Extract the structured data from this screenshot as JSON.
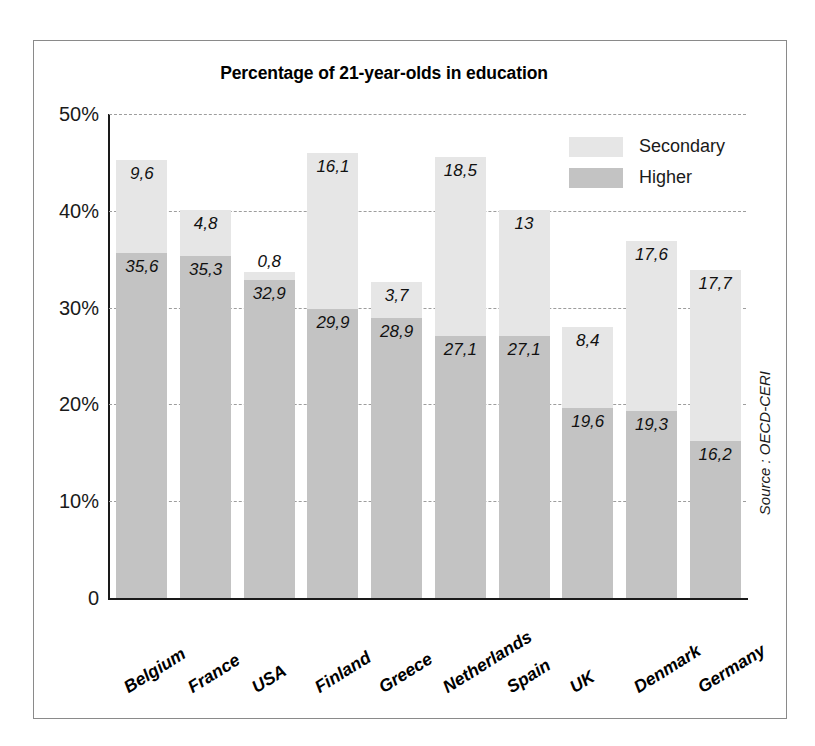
{
  "chart_data": {
    "type": "bar",
    "subtype": "stacked-vertical",
    "title": "Percentage of 21-year-olds in education",
    "xlabel": "",
    "ylabel": "",
    "ylim": [
      0,
      50
    ],
    "yunit": "%",
    "ytick_labels": [
      "0",
      "10%",
      "20%",
      "30%",
      "40%",
      "50%"
    ],
    "ytick_values": [
      0,
      10,
      20,
      30,
      40,
      50
    ],
    "grid": true,
    "grid_style": "dashed-horizontal",
    "legend_position": "top-right",
    "categories": [
      "Belgium",
      "France",
      "USA",
      "Finland",
      "Greece",
      "Netherlands",
      "Spain",
      "UK",
      "Denmark",
      "Germany"
    ],
    "series": [
      {
        "name": "Higher",
        "color": "#c3c3c3",
        "values": [
          35.6,
          35.3,
          32.9,
          29.9,
          28.9,
          27.1,
          27.1,
          19.6,
          19.3,
          16.2
        ],
        "labels": [
          "35,6",
          "35,3",
          "32,9",
          "29,9",
          "28,9",
          "27,1",
          "27,1",
          "19,6",
          "19,3",
          "16,2"
        ]
      },
      {
        "name": "Secondary",
        "color": "#e6e6e6",
        "values": [
          9.6,
          4.8,
          0.8,
          16.1,
          3.7,
          18.5,
          13,
          8.4,
          17.6,
          17.7
        ],
        "labels": [
          "9,6",
          "4,8",
          "0,8",
          "16,1",
          "3,7",
          "18,5",
          "13",
          "8,4",
          "17,6",
          "17,7"
        ]
      }
    ],
    "totals": [
      45.2,
      40.1,
      33.7,
      46.0,
      32.6,
      45.6,
      40.1,
      28.0,
      36.9,
      33.9
    ],
    "annotations": {
      "source": "Source : OECD-CERI"
    }
  },
  "legend": {
    "items": [
      {
        "label": "Secondary",
        "color": "#e6e6e6"
      },
      {
        "label": "Higher",
        "color": "#c3c3c3"
      }
    ]
  }
}
